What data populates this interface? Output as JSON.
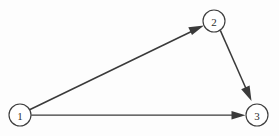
{
  "diagram": {
    "type": "directed-graph",
    "background_color": "#fdfdfd",
    "stroke_color": "#3a3a3a",
    "node_fill_color": "#ffffff",
    "label_color": "#2e2e2e",
    "nodes": [
      {
        "id": "1",
        "label": "1",
        "cx": 20,
        "cy": 115,
        "r": 11
      },
      {
        "id": "2",
        "label": "2",
        "cx": 214,
        "cy": 21,
        "r": 11
      },
      {
        "id": "3",
        "label": "3",
        "cx": 257,
        "cy": 115,
        "r": 11
      }
    ],
    "edges": [
      {
        "id": "edge-1-2",
        "from": "1",
        "to": "2",
        "directed": true,
        "arrowhead": "solid-triangle"
      },
      {
        "id": "edge-2-3",
        "from": "2",
        "to": "3",
        "directed": true,
        "arrowhead": "solid-triangle"
      },
      {
        "id": "edge-1-3",
        "from": "1",
        "to": "3",
        "directed": true,
        "arrowhead": "solid-triangle"
      }
    ]
  }
}
